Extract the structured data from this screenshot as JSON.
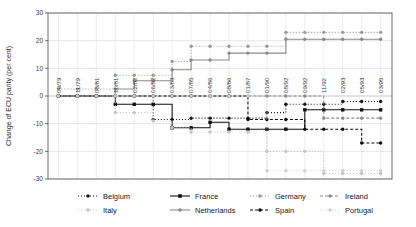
{
  "chart_data": {
    "type": "line",
    "title": "",
    "xlabel": "",
    "ylabel": "Change of ECU parity (per cent)",
    "ylim": [
      -30,
      30
    ],
    "yticks": [
      -30,
      -20,
      -10,
      0,
      10,
      20,
      30
    ],
    "ytick_labels": [
      "-30",
      "-20",
      "-10",
      "0",
      "10",
      "20",
      "30"
    ],
    "grid": true,
    "legend_position": "bottom",
    "categories": [
      "09/79",
      "11/79",
      "03/81",
      "10/81",
      "02/82",
      "06/82",
      "03/83",
      "07/85",
      "04/86",
      "08/86",
      "01/87",
      "01/90",
      "08/92",
      "09/92",
      "11/92",
      "02/93",
      "05/93",
      "03/95"
    ],
    "x": [
      "09/79",
      "11/79",
      "03/81",
      "10/81",
      "02/82",
      "06/82",
      "03/83",
      "07/85",
      "04/86",
      "08/86",
      "01/87",
      "01/90",
      "08/92",
      "09/92",
      "11/92",
      "02/93",
      "05/93",
      "03/95"
    ],
    "series": [
      {
        "name": "Belgium",
        "color": "#1a1a1a",
        "dash": "1,2",
        "marker": "circle",
        "values": [
          0,
          0,
          0,
          0,
          0,
          -8.5,
          -8.5,
          -8,
          -8,
          -8,
          -8,
          -6,
          -3,
          -3,
          -3,
          -2,
          -2,
          -2
        ]
      },
      {
        "name": "France",
        "color": "#111111",
        "dash": "none",
        "marker": "square",
        "values": [
          0,
          0,
          0,
          -3,
          -3,
          -3,
          -11.5,
          -11.5,
          -9.5,
          -12,
          -12,
          -12,
          -12,
          -5,
          -5,
          -5,
          -5,
          -5
        ]
      },
      {
        "name": "Germany",
        "color": "#9a9a9a",
        "dash": "1,2",
        "marker": "circle",
        "values": [
          2.5,
          2.5,
          2.5,
          7.5,
          7.5,
          7.5,
          12.5,
          18,
          18,
          18,
          18,
          18,
          23,
          23,
          23,
          23,
          23,
          23
        ]
      },
      {
        "name": "Ireland",
        "color": "#8c8c8c",
        "dash": "3,2",
        "marker": "circle",
        "values": [
          0,
          0,
          0,
          0,
          0,
          0,
          0,
          0,
          0,
          0,
          0,
          0,
          0,
          0,
          -8,
          -8,
          -8,
          -8
        ]
      },
      {
        "name": "Italy",
        "color": "#c4c4c4",
        "dash": "1,2",
        "marker": "circle",
        "values": [
          0,
          0,
          0,
          -6,
          -6,
          -9,
          -11.5,
          -13,
          -13,
          -13,
          -13,
          -20,
          -20,
          -20,
          -28,
          -28,
          -28,
          -28
        ]
      },
      {
        "name": "Netherlands",
        "color": "#8a8a8a",
        "dash": "none",
        "marker": "circle",
        "values": [
          0,
          0,
          0,
          2.5,
          5.5,
          5.5,
          9.5,
          13,
          13,
          15.5,
          15.5,
          15.5,
          20.5,
          20.5,
          20.5,
          20.5,
          20.5,
          20.5
        ]
      },
      {
        "name": "Spain",
        "color": "#0d0d0d",
        "dash": "3,2",
        "marker": "circle",
        "values": [
          0,
          0,
          0,
          0,
          0,
          0,
          0,
          0,
          0,
          0,
          -8.5,
          -8.5,
          -8.5,
          -12,
          -12,
          -12,
          -17,
          -17
        ]
      },
      {
        "name": "Portugal",
        "color": "#cfcfcf",
        "dash": "1,2",
        "marker": "circle",
        "values": [
          0,
          0,
          0,
          0,
          0,
          0,
          0,
          0,
          0,
          0,
          0,
          -27,
          -27,
          -27,
          -27,
          -27,
          -27,
          -27
        ]
      }
    ]
  },
  "legend": {
    "row1": [
      "Belgium",
      "France",
      "Germany",
      "Ireland"
    ],
    "row2": [
      "Italy",
      "Netherlands",
      "Spain",
      "Portugal"
    ]
  },
  "axis": {
    "y_title": "Change of ECU parity (per cent)"
  }
}
